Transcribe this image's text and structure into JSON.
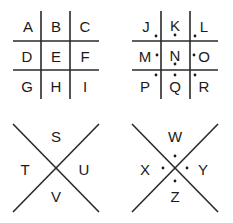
{
  "grid_plain": {
    "letters": [
      "A",
      "B",
      "C",
      "D",
      "E",
      "F",
      "G",
      "H",
      "I"
    ]
  },
  "grid_dotted": {
    "letters": [
      "J",
      "K",
      "L",
      "M",
      "N",
      "O",
      "P",
      "Q",
      "R"
    ]
  },
  "x_plain": {
    "top": "S",
    "left": "T",
    "right": "U",
    "bottom": "V"
  },
  "x_dotted": {
    "top": "W",
    "left": "X",
    "right": "Y",
    "bottom": "Z"
  },
  "colors": {
    "ink": "#1a1a1a",
    "background": "#ffffff"
  }
}
